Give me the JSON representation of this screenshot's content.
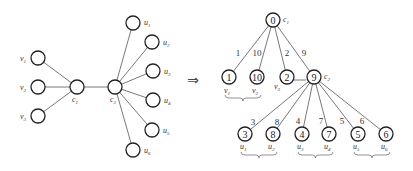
{
  "left_graph": {
    "nodes": [
      {
        "id": "v1",
        "label": "v",
        "sub": "1",
        "x": 38,
        "y": 58,
        "lx": 20,
        "ly": 61
      },
      {
        "id": "v2",
        "label": "v",
        "sub": "2",
        "x": 38,
        "y": 87,
        "lx": 20,
        "ly": 90
      },
      {
        "id": "v3",
        "label": "v",
        "sub": "3",
        "x": 38,
        "y": 116,
        "lx": 20,
        "ly": 119
      },
      {
        "id": "c1",
        "label": "c",
        "sub": "1",
        "x": 77,
        "y": 87,
        "lx": 72,
        "ly": 102
      },
      {
        "id": "c2",
        "label": "c",
        "sub": "2",
        "x": 115,
        "y": 87,
        "lx": 110,
        "ly": 102
      },
      {
        "id": "u1",
        "label": "u",
        "sub": "1",
        "x": 133,
        "y": 23,
        "lx": 144,
        "ly": 25
      },
      {
        "id": "u2",
        "label": "u",
        "sub": "2",
        "x": 152,
        "y": 42,
        "lx": 163,
        "ly": 45
      },
      {
        "id": "u3",
        "label": "u",
        "sub": "3",
        "x": 153,
        "y": 71,
        "lx": 164,
        "ly": 74
      },
      {
        "id": "u4",
        "label": "u",
        "sub": "4",
        "x": 153,
        "y": 100,
        "lx": 164,
        "ly": 103
      },
      {
        "id": "u5",
        "label": "u",
        "sub": "5",
        "x": 152,
        "y": 130,
        "lx": 163,
        "ly": 133
      },
      {
        "id": "u6",
        "label": "u",
        "sub": "6",
        "x": 133,
        "y": 150,
        "lx": 144,
        "ly": 153
      }
    ],
    "edges": [
      [
        "v1",
        "c1"
      ],
      [
        "v2",
        "c1"
      ],
      [
        "v3",
        "c1"
      ],
      [
        "c1",
        "c2"
      ],
      [
        "c2",
        "u1"
      ],
      [
        "c2",
        "u2"
      ],
      [
        "c2",
        "u3"
      ],
      [
        "c2",
        "u4"
      ],
      [
        "c2",
        "u5"
      ],
      [
        "c2",
        "u6"
      ]
    ]
  },
  "arrow": {
    "symbol": "⇒",
    "x": 193,
    "y": 85
  },
  "tree": {
    "root": {
      "id": "0",
      "value": "0",
      "label": "c",
      "sub": "1",
      "x": 273,
      "y": 20
    },
    "level1": [
      {
        "value": "1",
        "x": 229,
        "y": 77,
        "edge_weight": "1",
        "wx": 238,
        "wy": 56,
        "label": "v",
        "sub": "1"
      },
      {
        "value": "10",
        "x": 257,
        "y": 77,
        "edge_weight": "10",
        "wx": 257,
        "wy": 56,
        "label": "v",
        "sub": "2"
      },
      {
        "value": "2",
        "x": 287,
        "y": 77,
        "edge_weight": "2",
        "wx": 287,
        "wy": 56,
        "label": "v",
        "sub": "3"
      },
      {
        "value": "9",
        "x": 314,
        "y": 77,
        "edge_weight": "9",
        "wx": 304,
        "wy": 56,
        "label": "c",
        "sub": "2"
      }
    ],
    "level2": [
      {
        "value": "3",
        "x": 245,
        "y": 134,
        "edge_weight": "3",
        "wx": 253,
        "wy": 125,
        "label": "u",
        "sub": "1"
      },
      {
        "value": "8",
        "x": 273,
        "y": 134,
        "edge_weight": "8",
        "wx": 277,
        "wy": 125,
        "label": "u",
        "sub": "2"
      },
      {
        "value": "4",
        "x": 302,
        "y": 134,
        "edge_weight": "4",
        "wx": 298,
        "wy": 124,
        "label": "u",
        "sub": "3"
      },
      {
        "value": "7",
        "x": 329,
        "y": 134,
        "edge_weight": "7",
        "wx": 321,
        "wy": 124,
        "label": "u",
        "sub": "4"
      },
      {
        "value": "5",
        "x": 358,
        "y": 134,
        "edge_weight": "5",
        "wx": 342,
        "wy": 124,
        "label": "u",
        "sub": "5"
      },
      {
        "value": "6",
        "x": 386,
        "y": 134,
        "edge_weight": "6",
        "wx": 362,
        "wy": 124,
        "label": "u",
        "sub": "6"
      }
    ],
    "braces": [
      {
        "x1": 225,
        "x2": 261,
        "y": 98
      },
      {
        "x1": 241,
        "x2": 277,
        "y": 155
      },
      {
        "x1": 298,
        "x2": 333,
        "y": 155
      },
      {
        "x1": 354,
        "x2": 390,
        "y": 155
      }
    ]
  }
}
